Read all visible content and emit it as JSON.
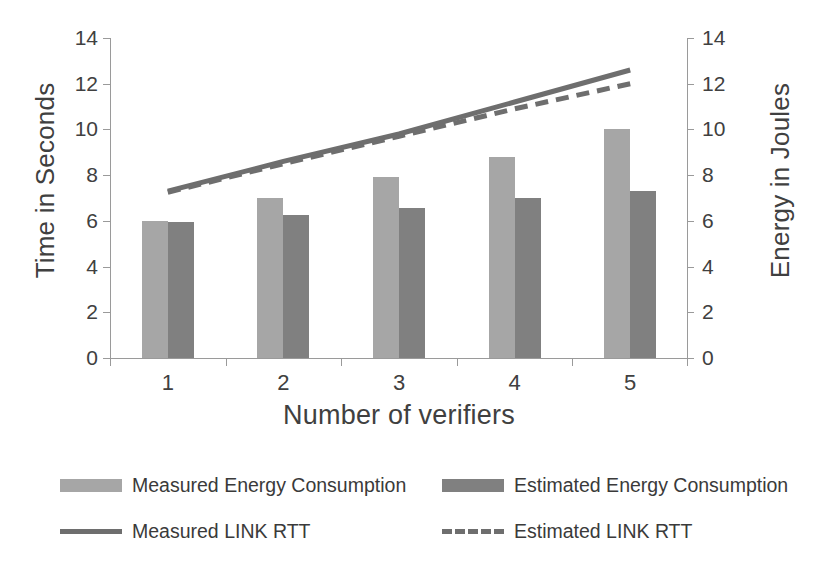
{
  "chart_data": {
    "type": "bar",
    "title": "",
    "subtitle": "",
    "xlabel": "Number of verifiers",
    "ylabel": "Time in Seconds",
    "y2label": "Energy in Joules",
    "categories": [
      "1",
      "2",
      "3",
      "4",
      "5"
    ],
    "ylim": [
      0,
      14
    ],
    "y2lim": [
      0,
      14
    ],
    "yticks": [
      "0",
      "2",
      "4",
      "6",
      "8",
      "10",
      "12",
      "14"
    ],
    "y2ticks": [
      "0",
      "2",
      "4",
      "6",
      "8",
      "10",
      "12",
      "14"
    ],
    "grid": false,
    "legend_position": "bottom",
    "series": [
      {
        "name": "Measured Energy Consumption",
        "kind": "bar",
        "axis": "right",
        "color": "#a6a6a6",
        "values": [
          6.0,
          7.0,
          7.9,
          8.8,
          10.0
        ]
      },
      {
        "name": "Estimated Energy Consumption",
        "kind": "bar",
        "axis": "right",
        "color": "#808080",
        "values": [
          5.95,
          6.25,
          6.55,
          7.0,
          7.3
        ]
      },
      {
        "name": "Measured LINK RTT",
        "kind": "line",
        "style": "solid",
        "axis": "left",
        "color": "#6e6e6e",
        "values": [
          7.3,
          8.6,
          9.8,
          11.2,
          12.6
        ]
      },
      {
        "name": "Estimated LINK RTT",
        "kind": "line",
        "style": "dashed",
        "axis": "left",
        "color": "#6e6e6e",
        "values": [
          7.25,
          8.5,
          9.7,
          10.9,
          12.0
        ]
      }
    ]
  },
  "legend": {
    "items": [
      {
        "label": "Measured Energy Consumption",
        "swatch": "bar-light-gray"
      },
      {
        "label": "Estimated Energy Consumption",
        "swatch": "bar-dark-gray"
      },
      {
        "label": "Measured LINK RTT",
        "swatch": "line-solid-gray"
      },
      {
        "label": "Estimated LINK RTT",
        "swatch": "line-dashed-gray"
      }
    ]
  },
  "colors": {
    "measured_bar": "#a6a6a6",
    "estimated_bar": "#808080",
    "line": "#6e6e6e",
    "axis": "#9a9a9a",
    "text": "#3a3a3a",
    "background": "#ffffff"
  }
}
